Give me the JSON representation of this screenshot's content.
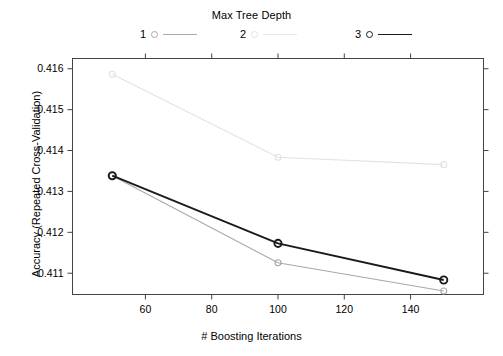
{
  "chart_data": {
    "type": "line",
    "title": "",
    "xlabel": "# Boosting Iterations",
    "ylabel": "Accuracy (Repeated Cross-Validation)",
    "legend_title": "Max Tree Depth",
    "legend_position": "top",
    "grid": false,
    "x": [
      50,
      100,
      150
    ],
    "xlim": [
      38,
      162
    ],
    "ylim": [
      0.41048,
      0.41625
    ],
    "xticks": [
      60,
      80,
      100,
      120,
      140
    ],
    "xticklabels": [
      "60",
      "80",
      "100",
      "120",
      "140"
    ],
    "yticks": [
      0.411,
      0.412,
      0.413,
      0.414,
      0.415,
      0.416
    ],
    "yticklabels": [
      "0.411",
      "0.412",
      "0.413",
      "0.414",
      "0.415",
      "0.416"
    ],
    "series": [
      {
        "name": "1",
        "legend_label": "1",
        "color": "#a8a8a8",
        "marker": "open-circle",
        "values": [
          0.413385,
          0.411255,
          0.410565
        ]
      },
      {
        "name": "2",
        "legend_label": "2",
        "color": "#e2e2e2",
        "marker": "open-circle",
        "values": [
          0.415865,
          0.413835,
          0.413655
        ]
      },
      {
        "name": "3",
        "legend_label": "3",
        "color": "#1a1a1a",
        "marker": "open-circle",
        "values": [
          0.413385,
          0.41173,
          0.410835
        ]
      }
    ]
  },
  "legend": {
    "title": "Max Tree Depth",
    "entries": [
      {
        "key": "1",
        "marker": "open-circle-icon",
        "line": "line-swatch"
      },
      {
        "key": "2",
        "marker": "open-circle-icon",
        "line": "line-swatch"
      },
      {
        "key": "3",
        "marker": "open-circle-icon",
        "line": "line-swatch"
      }
    ]
  },
  "axes": {
    "x_title": "# Boosting Iterations",
    "y_title": "Accuracy (Repeated Cross-Validation)"
  }
}
